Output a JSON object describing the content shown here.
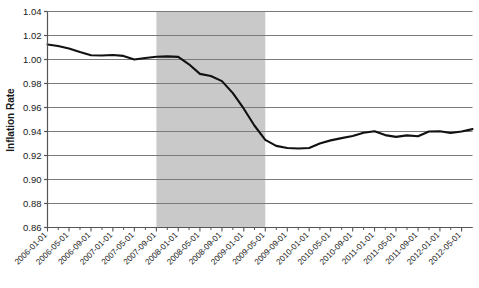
{
  "chart_data": {
    "type": "line",
    "title": "",
    "xlabel": "",
    "ylabel": "Inflation Rate",
    "ylim": [
      0.86,
      1.04
    ],
    "ytick_step": 0.02,
    "ytick_labels": [
      "1.04",
      "1.02",
      "1.00",
      "0.98",
      "0.96",
      "0.94",
      "0.92",
      "0.90",
      "0.88",
      "0.86"
    ],
    "ytick_values": [
      1.04,
      1.02,
      1.0,
      0.98,
      0.96,
      0.94,
      0.92,
      0.9,
      0.88,
      0.86
    ],
    "grid": true,
    "legend": "none",
    "categories": [
      "2006-01-01",
      "2006-05-01",
      "2006-09-01",
      "2007-01-01",
      "2007-05-01",
      "2007-09-01",
      "2008-01-01",
      "2008-05-01",
      "2008-09-01",
      "2009-01-01",
      "2009-05-01",
      "2009-09-01",
      "2010-01-01",
      "2010-05-01",
      "2010-09-01",
      "2011-01-01",
      "2011-05-01",
      "2011-09-01",
      "2012-01-01",
      "2012-05-01"
    ],
    "x_start": "2006-01-01",
    "x_end": "2012-07-01",
    "x_tick_interval_months": 4,
    "series": [
      {
        "name": "Inflation Rate",
        "color": "#111111",
        "x": [
          "2006-01-01",
          "2006-03-01",
          "2006-05-01",
          "2006-07-01",
          "2006-09-01",
          "2006-11-01",
          "2007-01-01",
          "2007-03-01",
          "2007-05-01",
          "2007-07-01",
          "2007-09-01",
          "2007-11-01",
          "2008-01-01",
          "2008-03-01",
          "2008-05-01",
          "2008-07-01",
          "2008-09-01",
          "2008-11-01",
          "2009-01-01",
          "2009-03-01",
          "2009-05-01",
          "2009-07-01",
          "2009-09-01",
          "2009-11-01",
          "2010-01-01",
          "2010-03-01",
          "2010-05-01",
          "2010-07-01",
          "2010-09-01",
          "2010-11-01",
          "2011-01-01",
          "2011-03-01",
          "2011-05-01",
          "2011-07-01",
          "2011-09-01",
          "2011-11-01",
          "2012-01-01",
          "2012-03-01",
          "2012-05-01",
          "2012-07-01"
        ],
        "values": [
          1.0125,
          1.0113,
          1.0092,
          1.0062,
          1.0036,
          1.0033,
          1.0038,
          1.003,
          1.0,
          1.0012,
          1.0023,
          1.0026,
          1.0022,
          0.996,
          0.988,
          0.9862,
          0.982,
          0.972,
          0.959,
          0.945,
          0.933,
          0.928,
          0.9262,
          0.9258,
          0.9262,
          0.93,
          0.9326,
          0.9345,
          0.9362,
          0.939,
          0.9402,
          0.937,
          0.9355,
          0.9368,
          0.936,
          0.94,
          0.9402,
          0.9388,
          0.94,
          0.942
        ]
      }
    ],
    "shaded_regions": [
      {
        "name": "recession-band",
        "start": "2007-09-01",
        "end": "2009-05-01",
        "color": "#c9c9c9"
      }
    ],
    "axis_color": "#555555",
    "grid_color": "#7a7a7a"
  }
}
